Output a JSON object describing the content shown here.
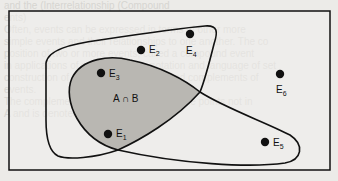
{
  "background_text": [
    "and the (Interrelationship (Compound",
    "ents)",
    "",
    "Often, events can be expressed in terms of other more",
    "simple events and their relationships to one another. The co",
    "position of two or more events, called a compound event",
    "in applications of set theory. The notation and language of set",
    "construction of unions, intersections, and complements of",
    "events.",
    "",
    "The complement of A consists of all sample points not in",
    "A and is denoted as A'."
  ],
  "diagram": {
    "intersection_label": "A ∩ B",
    "fill_color": "#b9b7b2",
    "line_color": "#111111",
    "points": [
      {
        "name": "E",
        "sub": "1",
        "x": 108,
        "y": 134
      },
      {
        "name": "E",
        "sub": "2",
        "x": 141,
        "y": 50
      },
      {
        "name": "E",
        "sub": "3",
        "x": 101,
        "y": 73
      },
      {
        "name": "E",
        "sub": "4",
        "x": 190,
        "y": 34
      },
      {
        "name": "E",
        "sub": "5",
        "x": 265,
        "y": 142
      },
      {
        "name": "E",
        "sub": "6",
        "x": 280,
        "y": 74
      }
    ]
  }
}
